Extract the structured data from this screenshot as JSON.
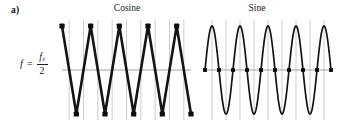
{
  "panel": {
    "label": "a)"
  },
  "formula": {
    "lhs": "f",
    "equals": "=",
    "numerator_base": "f",
    "numerator_sub": "s",
    "denominator": "2",
    "plain_text": "f = fs/2"
  },
  "plots": [
    {
      "id": "cosine",
      "title": "Cosine",
      "icon": "waveform-icon"
    },
    {
      "id": "sine",
      "title": "Sine",
      "icon": "waveform-icon"
    }
  ],
  "colors": {
    "waveform": "#141414",
    "gridline": "#b9b9b9",
    "zero_axis": "#8c8c8c",
    "sample_dot": "#0d0d0d",
    "background": "#ffffff"
  },
  "chart_data": [
    {
      "type": "line",
      "id": "cosine",
      "title": "Cosine",
      "subtitle": "f = fs/2",
      "xlabel": "",
      "ylabel": "",
      "xlim": [
        0,
        4.5
      ],
      "ylim": [
        -1,
        1
      ],
      "grid": true,
      "legend": "none",
      "description": "Continuous cosine sampled at the Nyquist rate fs/2; samples land exactly on alternating peaks and troughs so the reconstructed waveform is a full-amplitude zigzag.",
      "series": [
        {
          "name": "sampled cosine",
          "marker": "filled-square",
          "x": [
            0,
            0.5,
            1,
            1.5,
            2,
            2.5,
            3,
            3.5,
            4,
            4.5
          ],
          "values": [
            1,
            -1,
            1,
            -1,
            1,
            -1,
            1,
            -1,
            1,
            -1
          ]
        }
      ],
      "gridlines_x": [
        0.25,
        0.75,
        1.25,
        1.75,
        2.25,
        2.75,
        3.25,
        3.75,
        4.25
      ],
      "zero_axis_y": 0
    },
    {
      "type": "line",
      "id": "sine",
      "title": "Sine",
      "subtitle": "f = fs/2",
      "xlabel": "",
      "ylabel": "",
      "xlim": [
        0,
        4.5
      ],
      "ylim": [
        -1,
        1
      ],
      "grid": true,
      "legend": "none",
      "description": "Continuous sine sampled at the Nyquist rate fs/2; every sample falls on a zero crossing so the sampled signal is identically zero.",
      "series": [
        {
          "name": "continuous sine",
          "marker": "none",
          "x": [
            0,
            0.5,
            1,
            1.5,
            2,
            2.5,
            3,
            3.5,
            4,
            4.5
          ],
          "values": [
            0,
            0,
            0,
            0,
            0,
            0,
            0,
            0,
            0,
            0
          ]
        },
        {
          "name": "sampled sine",
          "marker": "filled-square",
          "x": [
            0,
            0.5,
            1,
            1.5,
            2,
            2.5,
            3,
            3.5,
            4,
            4.5
          ],
          "values": [
            0,
            0,
            0,
            0,
            0,
            0,
            0,
            0,
            0,
            0
          ]
        }
      ],
      "gridlines_x": [
        0.25,
        0.75,
        1.25,
        1.75,
        2.25,
        2.75,
        3.25,
        3.75,
        4.25
      ],
      "zero_axis_y": 0
    }
  ]
}
